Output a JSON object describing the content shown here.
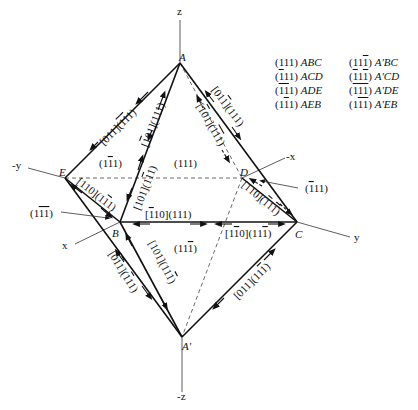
{
  "axes": {
    "z": "z",
    "neg_z": "-z",
    "y": "y",
    "neg_y": "-y",
    "x": "x",
    "neg_x": "-x"
  },
  "vertices": {
    "A": "A",
    "B": "B",
    "C": "C",
    "D": "D",
    "E": "E",
    "A_prime": "A'"
  },
  "faces": {
    "front_upper_right": "(111)",
    "front_upper_left": "(1̄1)",
    "front_lower": "(111̄)",
    "back_right": "(̄111)",
    "back_left": "(11̄1̄)"
  },
  "face_labels_display": {
    "f_111": [
      "(",
      "1",
      "1",
      "1",
      ")"
    ],
    "f_1b1": [
      "(1",
      "1",
      "1)"
    ],
    "f_11b": [
      "(11",
      "1",
      ")"
    ],
    "f_b11": [
      "(",
      "1",
      "11)"
    ],
    "f_1bb": [
      "(1",
      "11",
      ")"
    ]
  },
  "edges": {
    "AE": "[011](̄1̄1)",
    "AB": "[̄101](111)",
    "AD": "[̄101](̄1̄1)",
    "AC": "[01̄1](111)",
    "EB": "[110](1̄1)",
    "BE_lower": "[101](1̄1)",
    "BC": "[̄1 10](111)",
    "CB": "[1̄10](111̄)",
    "DC": "[110](̄1̄1)",
    "BA'": "[0̄11](̄11)",
    "BA'2": "[101](111̄)",
    "CA'": "[011](111̄)"
  },
  "legend": {
    "rows": [
      {
        "left_plane": "(111)",
        "left_face": "ABC",
        "right_plane": "(11̄ 1)",
        "right_face": "A'BC"
      },
      {
        "left_plane": "(̄111)",
        "left_face": "ACD",
        "right_plane": "(̄11̄1)",
        "right_face": "A'CD"
      },
      {
        "left_plane": "(̄1̄11)",
        "left_face": "ADE",
        "right_plane": "(̄1̄1̄1)",
        "right_face": "A'DE"
      },
      {
        "left_plane": "(1̄11)",
        "left_face": "AEB",
        "right_plane": "(1̄1̄1)",
        "right_face": "A'EB"
      }
    ]
  }
}
